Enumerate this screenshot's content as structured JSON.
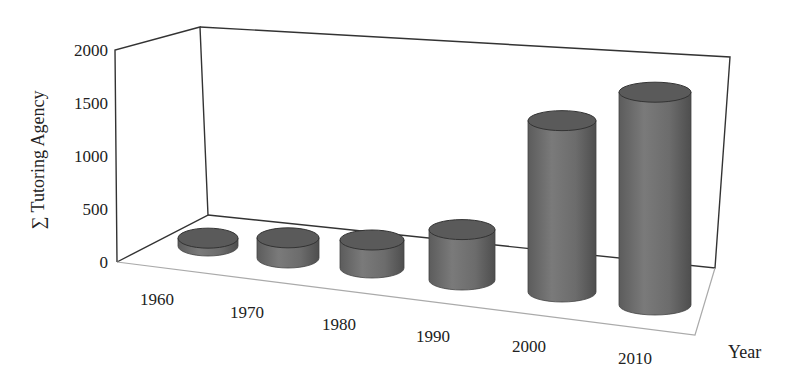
{
  "chart_data": {
    "type": "bar",
    "style": "3d-cylinder",
    "title": "",
    "xlabel": "Year",
    "ylabel": "∑ Tutoring Agency",
    "categories": [
      "1960",
      "1970",
      "1980",
      "1990",
      "2000",
      "2010"
    ],
    "values": [
      70,
      180,
      250,
      450,
      1530,
      1900
    ],
    "yticks": [
      "0",
      "500",
      "1000",
      "1500",
      "2000"
    ],
    "ylim": [
      0,
      2000
    ],
    "grid": false,
    "legend": null,
    "colors": {
      "bar": "#6e6e6e",
      "bar_top": "#5a5a5a",
      "frame": "#333333",
      "floor": "#aaaaaa"
    }
  }
}
